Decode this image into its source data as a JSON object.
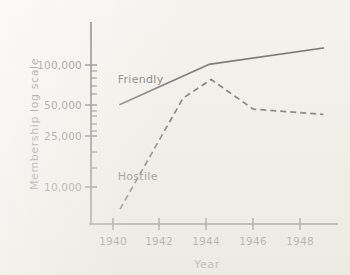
{
  "chart_data": {
    "type": "line",
    "title": "",
    "xlabel": "Year",
    "ylabel": "Membership  log  scale",
    "yscale": "log",
    "ylim": [
      6000,
      160000
    ],
    "xlim": [
      1939.4,
      1949.3
    ],
    "grid": false,
    "legend": "inline-labels",
    "xticks": [
      "1940",
      "1942",
      "1944",
      "1946",
      "1948"
    ],
    "xtick_values": [
      1940,
      1942,
      1944,
      1946,
      1948
    ],
    "yticks": [
      "100,000",
      "50,000",
      "25,000",
      "10,000"
    ],
    "ytick_values": [
      100000,
      50000,
      25000,
      10000
    ],
    "yminor_ticks": [
      90000,
      80000,
      70000,
      60000,
      45000,
      40000,
      35000,
      30000,
      20000,
      15000
    ],
    "series": [
      {
        "name": "Friendly",
        "style": "solid",
        "label_position": {
          "x": 1940.2,
          "y": 72000
        },
        "x": [
          1940.3,
          1944.1,
          1949.0
        ],
        "values": [
          49000,
          101000,
          136000
        ]
      },
      {
        "name": "Hostile",
        "style": "dashed",
        "label_position": {
          "x": 1940.2,
          "y": 12600
        },
        "x": [
          1940.3,
          1943.0,
          1944.2,
          1946.0,
          1949.0
        ],
        "values": [
          7400,
          55000,
          77000,
          45000,
          41000
        ]
      }
    ],
    "annotations": [
      {
        "text": "Friendly",
        "series": "Friendly"
      },
      {
        "text": "Hostile",
        "series": "Hostile"
      }
    ]
  },
  "colors": {
    "ink": "#1d1d1d",
    "paper": "#f3f1ec"
  }
}
